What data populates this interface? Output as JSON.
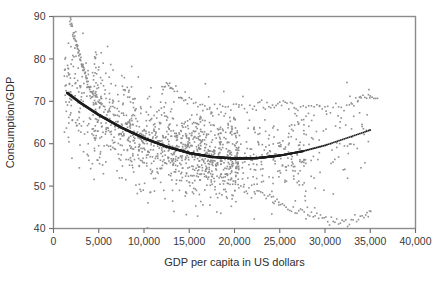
{
  "figure": {
    "background_color": "#ffffff",
    "frame_color": "#8c8c8c",
    "point_color": "#8e8e8e",
    "fit_color": "#1d1d1d"
  },
  "chart_data": {
    "type": "scatter",
    "title": "",
    "subtitle": "",
    "xlabel": "GDP per capita in US dollars",
    "ylabel": "Consumption/GDP",
    "xlim": [
      0,
      40000
    ],
    "ylim": [
      40,
      90
    ],
    "xticks": [
      0,
      5000,
      10000,
      15000,
      20000,
      25000,
      30000,
      35000,
      40000
    ],
    "xtick_labels": [
      "0",
      "5,000",
      "10,000",
      "15,000",
      "20,000",
      "25,000",
      "30,000",
      "35,000",
      "40,000"
    ],
    "yticks": [
      40,
      50,
      60,
      70,
      80,
      90
    ],
    "ytick_labels": [
      "40",
      "50",
      "60",
      "70",
      "80",
      "90"
    ],
    "grid": false,
    "legend": null,
    "annotations": [],
    "series": [
      {
        "name": "Observations",
        "type": "scatter",
        "color": "#8e8e8e",
        "marker": "square",
        "marker_size": 1.6,
        "n_points": 1450,
        "description": "Dense cloud of country-year observations; heavy mass between 5,000 and 28,000 US dollars with consumption share mostly 50-68 percent, fanning upward toward 90 at low income.",
        "generator": {
          "kind": "cloud",
          "x_range": [
            1200,
            36500
          ],
          "core_center_gdp": 17000,
          "core_center_ratio": 59.0,
          "spread_ratio": 5.2,
          "upper_tail_gdp": 4000,
          "upper_tail_ratio": 86.0
        }
      },
      {
        "name": "Fitted quadratic",
        "type": "line",
        "color": "#1d1d1d",
        "x": [
          1500,
          3000,
          5000,
          7500,
          10000,
          12500,
          15000,
          17500,
          20000,
          22500,
          25000,
          27500,
          30000,
          32500,
          35000
        ],
        "y": [
          72.0,
          69.6,
          66.8,
          63.8,
          61.3,
          59.3,
          57.8,
          56.9,
          56.5,
          56.6,
          57.2,
          58.2,
          59.6,
          61.4,
          63.2
        ],
        "minimum_x": 19000,
        "minimum_y": 56.5,
        "endpoint_left": {
          "x": 1500,
          "y": 72.0
        },
        "endpoint_right": {
          "x": 35000,
          "y": 63.2
        }
      },
      {
        "name": "High-ratio upper band",
        "type": "scatter",
        "color": "#8e8e8e",
        "description": "Sparse band of points near 67-71 percent extending from 12,000 to 36,000 US dollars.",
        "x": [
          12000,
          12600,
          13200,
          14000,
          15000,
          16200,
          17500,
          19000,
          20500,
          22000,
          23000,
          24000,
          25000,
          26000,
          27000,
          28500,
          30000,
          31500,
          33000,
          34000,
          35000,
          36000
        ],
        "y": [
          73.5,
          74.0,
          73.2,
          71.0,
          70.0,
          69.2,
          68.4,
          68.8,
          69.0,
          68.5,
          69.2,
          68.3,
          69.4,
          69.6,
          68.8,
          69.0,
          68.6,
          68.4,
          69.5,
          71.2,
          71.0,
          70.8
        ]
      },
      {
        "name": "Low-ratio descending band",
        "type": "scatter",
        "color": "#8e8e8e",
        "description": "Trajectory falling from about 50 percent at 20,000 to near 41 percent at 32,000, recovering to 44 at 35,000.",
        "x": [
          19500,
          21000,
          22500,
          23500,
          24500,
          25500,
          26500,
          27500,
          28500,
          29500,
          30500,
          31500,
          32500,
          33500,
          34500,
          35200
        ],
        "y": [
          50.2,
          49.6,
          48.8,
          47.9,
          46.8,
          45.6,
          44.6,
          43.8,
          43.2,
          42.6,
          42.0,
          41.4,
          41.2,
          41.8,
          43.0,
          44.2
        ]
      },
      {
        "name": "Steep low-income descent",
        "type": "scatter",
        "color": "#8e8e8e",
        "description": "Near-vertical stream of points from about 90 percent at 2,000 US dollars down to 70 percent at 5,000.",
        "x": [
          1800,
          2000,
          2200,
          2400,
          2600,
          2800,
          3000,
          3200,
          3400,
          3600,
          3800,
          4000,
          4300,
          4600,
          5000,
          5400
        ],
        "y": [
          89.5,
          88.0,
          86.0,
          84.2,
          83.0,
          81.5,
          80.0,
          78.2,
          77.0,
          75.5,
          74.0,
          73.0,
          72.0,
          71.0,
          70.2,
          69.5
        ]
      }
    ]
  }
}
